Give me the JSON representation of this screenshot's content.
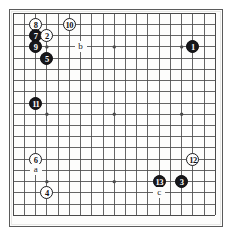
{
  "diagram": {
    "type": "go-board-diagram",
    "board_size": 19,
    "colors": {
      "black_stone": "#17171a",
      "white_stone": "#ffffff",
      "stone_outline": "#1d1d1f",
      "grid_line": "#4a4a4a",
      "frame": "#5b5b5b",
      "background": "#fdfdfc"
    },
    "geometry": {
      "frame_left": 9,
      "frame_top": 9,
      "frame_width": 214,
      "frame_height": 218,
      "origin_x": 13.2,
      "origin_y": 13.2,
      "step_x": 11.23,
      "step_y": 11.23
    },
    "star_points": [
      {
        "col": 3,
        "row": 3
      },
      {
        "col": 9,
        "row": 3
      },
      {
        "col": 15,
        "row": 3
      },
      {
        "col": 3,
        "row": 9
      },
      {
        "col": 9,
        "row": 9
      },
      {
        "col": 15,
        "row": 9
      },
      {
        "col": 3,
        "row": 15
      },
      {
        "col": 9,
        "row": 15
      },
      {
        "col": 15,
        "row": 15
      }
    ],
    "stones": [
      {
        "number": "8",
        "color": "white",
        "col": 2,
        "row": 1
      },
      {
        "number": "10",
        "color": "white",
        "col": 5,
        "row": 1
      },
      {
        "number": "7",
        "color": "black",
        "col": 2,
        "row": 2
      },
      {
        "number": "2",
        "color": "white",
        "col": 3,
        "row": 2
      },
      {
        "number": "9",
        "color": "black",
        "col": 2,
        "row": 3
      },
      {
        "number": "1",
        "color": "black",
        "col": 16,
        "row": 3
      },
      {
        "number": "5",
        "color": "black",
        "col": 3,
        "row": 4
      },
      {
        "number": "11",
        "color": "black",
        "col": 2,
        "row": 8
      },
      {
        "number": "6",
        "color": "white",
        "col": 2,
        "row": 13
      },
      {
        "number": "12",
        "color": "white",
        "col": 16,
        "row": 13
      },
      {
        "number": "13",
        "color": "black",
        "col": 13,
        "row": 15
      },
      {
        "number": "3",
        "color": "black",
        "col": 15,
        "row": 15
      },
      {
        "number": "4",
        "color": "white",
        "col": 3,
        "row": 16
      }
    ],
    "point_labels": [
      {
        "label": "b",
        "col": 6,
        "row": 3
      },
      {
        "label": "a",
        "col": 2,
        "row": 14
      },
      {
        "label": "c",
        "col": 13,
        "row": 16
      }
    ]
  }
}
